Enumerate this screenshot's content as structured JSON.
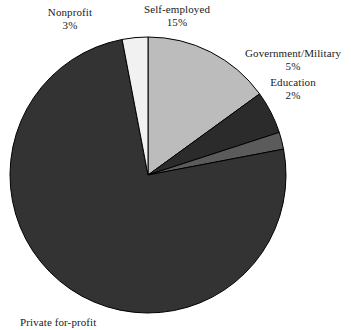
{
  "chart_data": {
    "type": "pie",
    "title": "",
    "subtitle": "",
    "xlabel": "",
    "ylabel": "",
    "legend_position": "none",
    "grid": false,
    "units": "percent",
    "categories": [
      "Self-employed",
      "Government/Military",
      "Education",
      "Private for-profit",
      "Nonprofit"
    ],
    "values": [
      15,
      5,
      2,
      75,
      3
    ],
    "slices": [
      {
        "id": "self-employed",
        "label": "Self-employed",
        "percent_text": "15%",
        "value": 15,
        "color": "#bcbcbc",
        "start_angle_deg": 0,
        "end_angle_deg": 54
      },
      {
        "id": "government-military",
        "label": "Government/Military",
        "percent_text": "5%",
        "value": 5,
        "color": "#2b2b2b",
        "start_angle_deg": 54,
        "end_angle_deg": 72
      },
      {
        "id": "education",
        "label": "Education",
        "percent_text": "2%",
        "value": 2,
        "color": "#5b5b5b",
        "start_angle_deg": 72,
        "end_angle_deg": 79.2
      },
      {
        "id": "private-for-profit",
        "label": "Private for-profit",
        "percent_text": "",
        "value": 75,
        "color": "#333333",
        "start_angle_deg": 79.2,
        "end_angle_deg": 349.2
      },
      {
        "id": "nonprofit",
        "label": "Nonprofit",
        "percent_text": "3%",
        "value": 3,
        "color": "#f1f1f1",
        "start_angle_deg": 349.2,
        "end_angle_deg": 360
      }
    ],
    "geometry": {
      "center_x": 148,
      "center_y": 175,
      "radius": 138,
      "start_at_top": true,
      "direction": "clockwise"
    },
    "stroke_color": "#000000",
    "background_color": "#ffffff"
  },
  "labels": {
    "nonprofit": {
      "name": "Nonprofit",
      "percent": "3%"
    },
    "self_employed": {
      "name": "Self-employed",
      "percent": "15%"
    },
    "government": {
      "name": "Government/Military",
      "percent": "5%"
    },
    "education": {
      "name": "Education",
      "percent": "2%"
    },
    "private": {
      "name": "Private for-profit",
      "percent": ""
    }
  }
}
